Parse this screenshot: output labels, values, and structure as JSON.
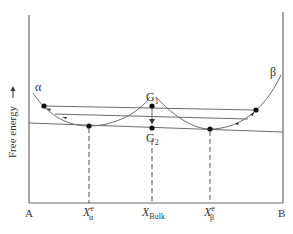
{
  "diagram": {
    "y_axis_label": "Free energy",
    "y_axis_arrow": "up-arrow",
    "x_axis": {
      "left_label": "A",
      "right_label": "B",
      "ticks": [
        {
          "id": "x-alpha-e",
          "main": "X",
          "sup": "e",
          "sub": "α"
        },
        {
          "id": "x-bulk",
          "main": "X",
          "sup": "",
          "sub": "Bulk"
        },
        {
          "id": "x-beta-e",
          "main": "X",
          "sup": "e",
          "sub": "β"
        }
      ]
    },
    "phases": [
      {
        "name": "α",
        "label": "α"
      },
      {
        "name": "β",
        "label": "β"
      }
    ],
    "points": {
      "g1": {
        "main": "G",
        "sub": "1"
      },
      "g2": {
        "main": "G",
        "sub": "2"
      }
    },
    "colors": {
      "line": "#6b6b6b",
      "dot": "#111111",
      "text": "#333333"
    }
  }
}
